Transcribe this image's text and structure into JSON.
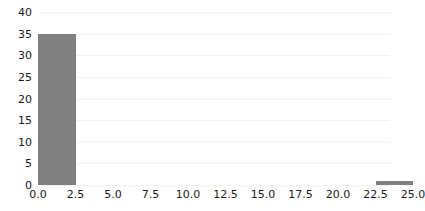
{
  "chart_data": {
    "type": "bar",
    "title": "",
    "subtitle": "",
    "xlabel": "",
    "ylabel": "",
    "xlim": [
      0.0,
      25.0
    ],
    "ylim": [
      0,
      40
    ],
    "grid": true,
    "legend": null,
    "bin_width": 2.5,
    "xticks": [
      "0.0",
      "2.5",
      "5.0",
      "7.5",
      "10.0",
      "12.5",
      "15.0",
      "17.5",
      "20.0",
      "22.5",
      "25.0"
    ],
    "xtick_values": [
      0.0,
      2.5,
      5.0,
      7.5,
      10.0,
      12.5,
      15.0,
      17.5,
      20.0,
      22.5,
      25.0
    ],
    "yticks": [
      "0",
      "5",
      "10",
      "15",
      "20",
      "25",
      "30",
      "35",
      "40"
    ],
    "ytick_values": [
      0,
      5,
      10,
      15,
      20,
      25,
      30,
      35,
      40
    ],
    "categories": [
      "0.0-2.5",
      "2.5-5.0",
      "5.0-7.5",
      "7.5-10.0",
      "10.0-12.5",
      "12.5-15.0",
      "15.0-17.5",
      "17.5-20.0",
      "20.0-22.5",
      "22.5-25.0"
    ],
    "bin_starts": [
      0.0,
      2.5,
      5.0,
      7.5,
      10.0,
      12.5,
      15.0,
      17.5,
      20.0,
      22.5
    ],
    "values": [
      35,
      0,
      0,
      0,
      0,
      0,
      0,
      0,
      0,
      1
    ],
    "bar_color": "#808080",
    "grid_color": "#f2f2f2",
    "background_color": "#ffffff"
  }
}
